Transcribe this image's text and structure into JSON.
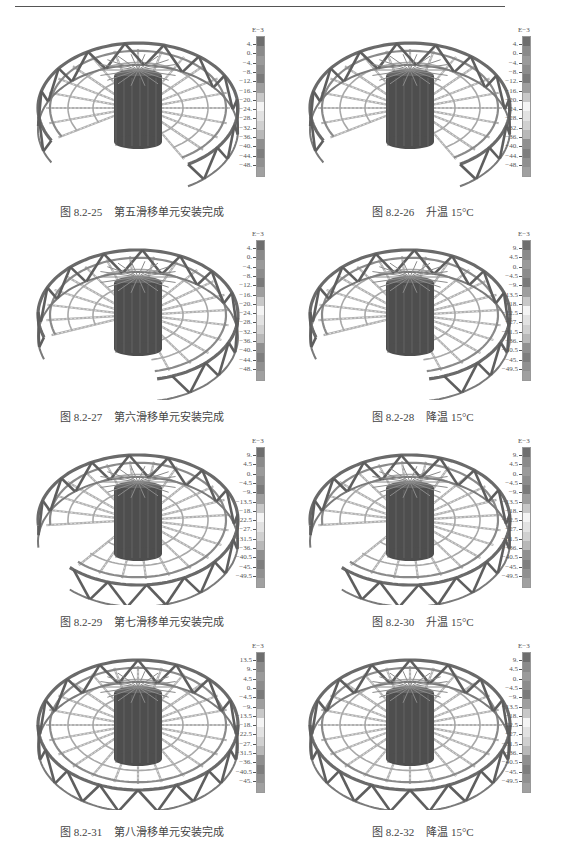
{
  "page": {
    "header_rule": true
  },
  "figures": [
    {
      "id": "8.2-25",
      "caption_num": "图 8.2-25",
      "caption_text": "第五滑移单元安装完成",
      "stage": "partial-5",
      "legend": {
        "unit": "E−3",
        "labels": [
          "4.",
          "0.",
          "−4.",
          "−8.",
          "−12.",
          "−16.",
          "−20.",
          "−24.",
          "−28.",
          "−32.",
          "−36.",
          "−40.",
          "−44.",
          "−48."
        ]
      }
    },
    {
      "id": "8.2-26",
      "caption_num": "图 8.2-26",
      "caption_text": "升温 15°C",
      "stage": "partial-5",
      "legend": {
        "unit": "E−3",
        "labels": [
          "4.",
          "0.",
          "−4.",
          "−8.",
          "−12.",
          "−16.",
          "−20.",
          "−24.",
          "−28.",
          "−32.",
          "−36.",
          "−40.",
          "−44.",
          "−48."
        ]
      }
    },
    {
      "id": "8.2-27",
      "caption_num": "图 8.2-27",
      "caption_text": "第六滑移单元安装完成",
      "stage": "partial-6",
      "legend": {
        "unit": "E−3",
        "labels": [
          "4.",
          "0.",
          "−4.",
          "−8.",
          "−12.",
          "−16.",
          "−20.",
          "−24.",
          "−28.",
          "−32.",
          "−36.",
          "−40.",
          "−44.",
          "−48."
        ]
      }
    },
    {
      "id": "8.2-28",
      "caption_num": "图 8.2-28",
      "caption_text": "降温 15°C",
      "stage": "partial-6",
      "legend": {
        "unit": "E−3",
        "labels": [
          "9.",
          "4.5",
          "0.",
          "−4.5",
          "−9.",
          "−13.5",
          "−18.",
          "−22.5",
          "−27.",
          "−31.5",
          "−36.",
          "−40.5",
          "−45.",
          "−49.5"
        ]
      }
    },
    {
      "id": "8.2-29",
      "caption_num": "图 8.2-29",
      "caption_text": "第七滑移单元安装完成",
      "stage": "partial-7",
      "legend": {
        "unit": "E−3",
        "labels": [
          "9.",
          "4.5",
          "0.",
          "−4.5",
          "−9.",
          "−13.5",
          "−18.",
          "−22.5",
          "−27.",
          "−31.5",
          "−36.",
          "−40.5",
          "−45.",
          "−49.5"
        ]
      }
    },
    {
      "id": "8.2-30",
      "caption_num": "图 8.2-30",
      "caption_text": "升温 15°C",
      "stage": "partial-7",
      "legend": {
        "unit": "E−3",
        "labels": [
          "9.",
          "4.5",
          "0.",
          "−4.5",
          "−9.",
          "−13.5",
          "−18.",
          "−22.5",
          "−27.",
          "−31.5",
          "−36.",
          "−40.5",
          "−45.",
          "−49.5"
        ]
      }
    },
    {
      "id": "8.2-31",
      "caption_num": "图 8.2-31",
      "caption_text": "第八滑移单元安装完成",
      "stage": "full",
      "legend": {
        "unit": "E−3",
        "labels": [
          "13.5",
          "9.",
          "4.5",
          "0.",
          "−4.5",
          "−9.",
          "−13.5",
          "−18.",
          "−22.5",
          "−27.",
          "−31.5",
          "−36.",
          "−40.5",
          "−45."
        ]
      }
    },
    {
      "id": "8.2-32",
      "caption_num": "图 8.2-32",
      "caption_text": "降温 15°C",
      "stage": "full",
      "legend": {
        "unit": "E−3",
        "labels": [
          "9.",
          "4.5",
          "0.",
          "−4.5",
          "−9.",
          "−13.5",
          "−18.",
          "−22.5",
          "−27.",
          "−31.5",
          "−36.",
          "−40.5",
          "−45.",
          "−49.5"
        ]
      }
    }
  ],
  "legend_colors": [
    "#6e6e6e",
    "#8a8a8a",
    "#9a9a9a",
    "#8c8c8c",
    "#7a7a7a",
    "#9e9e9e",
    "#c8c8c8",
    "#f4f4f4",
    "#e2e2e2",
    "#d0d0d0",
    "#b8b8b8",
    "#8f8f8f",
    "#7e7e7e",
    "#909090",
    "#a0a0a0"
  ]
}
